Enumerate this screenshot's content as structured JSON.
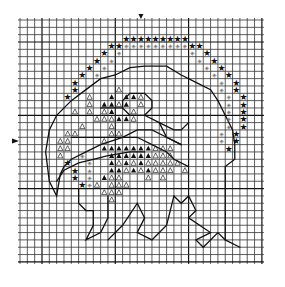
{
  "pattern": {
    "title": "Eagle head cross-stitch chart",
    "grid": {
      "origin_x": 20,
      "origin_y": 20,
      "cell": 7.33,
      "cols": 33,
      "rows": 33,
      "heavy_every": 10,
      "heavy_offset": 3
    },
    "center_markers": {
      "top": {
        "col": 16.5,
        "glyph": "▼"
      },
      "left": {
        "row": 16.5,
        "glyph": "▶"
      }
    },
    "legend": {
      "star": {
        "glyph": "★",
        "meaning": "dark border stitch",
        "color": "#111111"
      },
      "diamond": {
        "glyph": "◈",
        "meaning": "light border stitch",
        "color": "#777777"
      },
      "filled_triangle": {
        "glyph": "▲",
        "meaning": "dark stitch",
        "color": "#111111"
      },
      "open_triangle": {
        "glyph": "△",
        "meaning": "light stitch",
        "color": "#222222"
      }
    },
    "stars": [
      [
        14,
        2
      ],
      [
        15,
        2
      ],
      [
        16,
        2
      ],
      [
        17,
        2
      ],
      [
        18,
        2
      ],
      [
        19,
        2
      ],
      [
        20,
        2
      ],
      [
        21,
        2
      ],
      [
        22,
        2
      ],
      [
        12,
        3
      ],
      [
        13,
        3
      ],
      [
        23,
        3
      ],
      [
        24,
        3
      ],
      [
        11,
        4
      ],
      [
        25,
        4
      ],
      [
        10,
        5
      ],
      [
        26,
        5
      ],
      [
        9,
        6
      ],
      [
        27,
        6
      ],
      [
        8,
        7
      ],
      [
        28,
        7
      ],
      [
        7,
        8
      ],
      [
        29,
        8
      ],
      [
        7,
        9
      ],
      [
        29,
        9
      ],
      [
        6,
        10
      ],
      [
        30,
        10
      ],
      [
        30,
        11
      ],
      [
        30,
        12
      ],
      [
        30,
        13
      ],
      [
        30,
        14
      ],
      [
        29,
        15
      ],
      [
        29,
        16
      ],
      [
        28,
        17
      ],
      [
        6,
        19
      ],
      [
        7,
        20
      ],
      [
        7,
        21
      ],
      [
        8,
        22
      ]
    ],
    "diamonds": [
      [
        14,
        3
      ],
      [
        15,
        3
      ],
      [
        16,
        3
      ],
      [
        17,
        3
      ],
      [
        18,
        3
      ],
      [
        19,
        3
      ],
      [
        20,
        3
      ],
      [
        21,
        3
      ],
      [
        22,
        3
      ],
      [
        13,
        4
      ],
      [
        23,
        4
      ],
      [
        12,
        5
      ],
      [
        24,
        5
      ],
      [
        11,
        6
      ],
      [
        25,
        6
      ],
      [
        10,
        7
      ],
      [
        26,
        7
      ],
      [
        27,
        8
      ],
      [
        27,
        9
      ],
      [
        28,
        10
      ],
      [
        28,
        11
      ],
      [
        28,
        12
      ],
      [
        28,
        13
      ],
      [
        28,
        14
      ],
      [
        27,
        15
      ],
      [
        27,
        16
      ],
      [
        8,
        18
      ],
      [
        9,
        19
      ],
      [
        9,
        20
      ],
      [
        9,
        21
      ],
      [
        9,
        22
      ]
    ],
    "filled_triangles": [
      [
        12,
        10
      ],
      [
        14,
        10
      ],
      [
        15,
        10
      ],
      [
        11,
        11
      ],
      [
        12,
        11
      ],
      [
        14,
        11
      ],
      [
        12,
        12
      ],
      [
        13,
        13
      ],
      [
        14,
        13
      ],
      [
        11,
        17
      ],
      [
        12,
        17
      ],
      [
        13,
        17
      ],
      [
        14,
        17
      ],
      [
        15,
        17
      ],
      [
        16,
        17
      ],
      [
        17,
        17
      ],
      [
        12,
        18
      ],
      [
        13,
        18
      ],
      [
        14,
        18
      ],
      [
        15,
        18
      ],
      [
        16,
        18
      ],
      [
        17,
        18
      ],
      [
        12,
        19
      ],
      [
        14,
        19
      ],
      [
        16,
        19
      ],
      [
        12,
        20
      ],
      [
        13,
        20
      ],
      [
        15,
        20
      ],
      [
        17,
        20
      ],
      [
        11,
        21
      ]
    ],
    "open_triangles": [
      [
        13,
        9
      ],
      [
        9,
        10
      ],
      [
        16,
        10
      ],
      [
        9,
        11
      ],
      [
        13,
        11
      ],
      [
        16,
        11
      ],
      [
        7,
        12
      ],
      [
        9,
        12
      ],
      [
        11,
        12
      ],
      [
        15,
        12
      ],
      [
        10,
        13
      ],
      [
        11,
        13
      ],
      [
        12,
        13
      ],
      [
        15,
        13
      ],
      [
        8,
        14
      ],
      [
        12,
        14
      ],
      [
        6,
        15
      ],
      [
        7,
        15
      ],
      [
        12,
        15
      ],
      [
        13,
        15
      ],
      [
        5,
        16
      ],
      [
        6,
        16
      ],
      [
        11,
        16
      ],
      [
        5,
        17
      ],
      [
        6,
        17
      ],
      [
        18,
        17
      ],
      [
        19,
        17
      ],
      [
        20,
        17
      ],
      [
        5,
        18
      ],
      [
        18,
        18
      ],
      [
        19,
        18
      ],
      [
        20,
        18
      ],
      [
        13,
        19
      ],
      [
        15,
        19
      ],
      [
        17,
        19
      ],
      [
        18,
        19
      ],
      [
        19,
        19
      ],
      [
        20,
        19
      ],
      [
        21,
        19
      ],
      [
        14,
        20
      ],
      [
        16,
        20
      ],
      [
        18,
        20
      ],
      [
        19,
        20
      ],
      [
        20,
        20
      ],
      [
        22,
        20
      ],
      [
        12,
        21
      ],
      [
        13,
        21
      ],
      [
        17,
        21
      ],
      [
        19,
        21
      ],
      [
        10,
        22
      ],
      [
        12,
        22
      ],
      [
        13,
        22
      ],
      [
        14,
        22
      ],
      [
        11,
        23
      ],
      [
        12,
        23
      ],
      [
        13,
        23
      ],
      [
        12,
        24
      ]
    ],
    "outlines": [
      {
        "name": "head-top-outline",
        "points": [
          [
            4,
            15
          ],
          [
            5,
            13
          ],
          [
            7,
            11
          ],
          [
            9,
            9.5
          ],
          [
            11,
            8
          ],
          [
            13,
            7.5
          ],
          [
            15,
            6.5
          ],
          [
            17,
            6.3
          ],
          [
            20,
            6.3
          ],
          [
            22,
            7.5
          ],
          [
            24,
            8.5
          ],
          [
            26,
            9.5
          ],
          [
            27,
            11
          ],
          [
            28,
            13
          ],
          [
            29,
            15
          ],
          [
            29.3,
            17
          ],
          [
            29.3,
            19
          ],
          [
            28,
            20
          ],
          [
            28,
            30
          ]
        ]
      },
      {
        "name": "beak-outer-outline",
        "points": [
          [
            4,
            15
          ],
          [
            3.5,
            18
          ],
          [
            4,
            22
          ],
          [
            5,
            24
          ],
          [
            5.5,
            21
          ],
          [
            6,
            20
          ],
          [
            7,
            19
          ],
          [
            9,
            18
          ],
          [
            11,
            17
          ],
          [
            14,
            16
          ],
          [
            16,
            15
          ],
          [
            18,
            15
          ],
          [
            20,
            16
          ],
          [
            22,
            17
          ]
        ]
      },
      {
        "name": "beak-inner-outline",
        "points": [
          [
            5,
            22
          ],
          [
            6,
            20.5
          ],
          [
            8,
            19.5
          ],
          [
            10,
            19
          ],
          [
            12,
            18.5
          ],
          [
            15,
            18
          ],
          [
            17,
            18
          ]
        ]
      },
      {
        "name": "eye-outline",
        "points": [
          [
            14,
            11
          ],
          [
            15,
            10
          ],
          [
            17,
            10
          ],
          [
            18,
            11
          ],
          [
            18,
            12
          ],
          [
            17,
            13
          ],
          [
            15,
            13
          ],
          [
            14,
            12
          ],
          [
            14,
            11
          ]
        ]
      },
      {
        "name": "brow-outline",
        "points": [
          [
            11,
            12
          ],
          [
            13,
            12
          ],
          [
            14,
            12
          ]
        ]
      },
      {
        "name": "mouth-line",
        "points": [
          [
            7,
            16
          ],
          [
            12,
            16
          ],
          [
            14,
            16
          ],
          [
            16,
            16
          ],
          [
            18,
            17
          ],
          [
            20,
            18
          ],
          [
            21,
            19
          ],
          [
            23,
            20
          ]
        ]
      },
      {
        "name": "neck-outline",
        "points": [
          [
            17,
            13
          ],
          [
            19,
            14
          ],
          [
            21,
            15
          ],
          [
            22,
            15
          ],
          [
            23,
            14
          ]
        ]
      },
      {
        "name": "cheek-outline",
        "points": [
          [
            19,
            14
          ],
          [
            20,
            16
          ],
          [
            22,
            17
          ]
        ]
      },
      {
        "name": "neck-bottom-left",
        "points": [
          [
            8,
            23
          ],
          [
            8,
            25
          ],
          [
            9,
            26
          ],
          [
            10,
            26
          ],
          [
            10,
            28
          ],
          [
            9,
            30
          ],
          [
            11,
            29
          ],
          [
            12,
            27
          ],
          [
            12,
            24
          ]
        ]
      },
      {
        "name": "feathers-bottom",
        "points": [
          [
            12,
            30
          ],
          [
            14,
            28
          ],
          [
            16,
            25
          ],
          [
            17,
            27
          ],
          [
            16,
            29
          ],
          [
            18,
            30
          ],
          [
            20,
            28
          ],
          [
            21,
            24
          ],
          [
            22,
            25
          ],
          [
            23,
            24
          ],
          [
            24,
            26
          ],
          [
            23,
            27
          ],
          [
            26,
            29
          ],
          [
            24,
            30
          ],
          [
            25,
            31
          ],
          [
            27,
            29
          ],
          [
            28,
            30
          ],
          [
            30,
            31
          ]
        ]
      }
    ]
  }
}
